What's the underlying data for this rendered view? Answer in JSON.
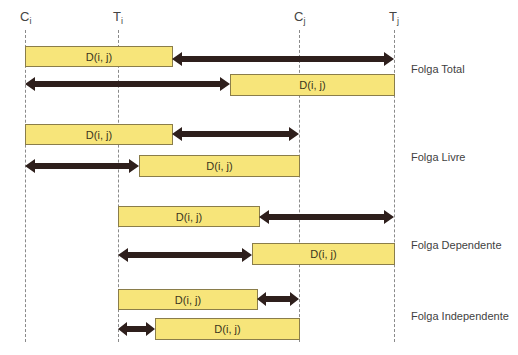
{
  "markers": [
    {
      "id": "ci",
      "base": "C",
      "sub": "i",
      "x": 25
    },
    {
      "id": "ti",
      "base": "T",
      "sub": "i",
      "x": 118
    },
    {
      "id": "cj",
      "base": "C",
      "sub": "j",
      "x": 299
    },
    {
      "id": "tj",
      "base": "T",
      "sub": "j",
      "x": 394
    }
  ],
  "bar_label": "D(i, j)",
  "colors": {
    "bar_fill": "#f7e57a",
    "bar_border": "#8a7d4a",
    "arrow": "#2e1f1c",
    "dashed_line": "#8a8a8a"
  },
  "groups": [
    {
      "label": "Folga Total",
      "rows": [
        {
          "bar": [
            25,
            172
          ],
          "arrow": [
            172,
            394
          ],
          "heads": "left-right",
          "label": "D(i, j)"
        },
        {
          "bar": [
            230,
            394
          ],
          "arrow": [
            25,
            230
          ],
          "heads": "left-right",
          "label": "D(i, j)"
        }
      ]
    },
    {
      "label": "Folga Livre",
      "rows": [
        {
          "bar": [
            25,
            172
          ],
          "arrow": [
            172,
            299
          ],
          "heads": "left-right",
          "label": "D(i, j)"
        },
        {
          "bar": [
            139,
            299
          ],
          "arrow": [
            25,
            139
          ],
          "heads": "left-right",
          "label": "D(i, j)"
        }
      ]
    },
    {
      "label": "Folga Dependente",
      "rows": [
        {
          "bar": [
            118,
            259
          ],
          "arrow": [
            259,
            394
          ],
          "heads": "left-right",
          "label": "D(i, j)"
        },
        {
          "bar": [
            252,
            394
          ],
          "arrow": [
            118,
            252
          ],
          "heads": "left-right",
          "label": "D(i, j)"
        }
      ]
    },
    {
      "label": "Folga Independente",
      "rows": [
        {
          "bar": [
            118,
            257
          ],
          "arrow": [
            257,
            299
          ],
          "heads": "left-right",
          "label": "D(i, j)"
        },
        {
          "bar": [
            155,
            299
          ],
          "arrow": [
            118,
            155
          ],
          "heads": "left-right",
          "label": "D(i, j)"
        }
      ]
    }
  ]
}
